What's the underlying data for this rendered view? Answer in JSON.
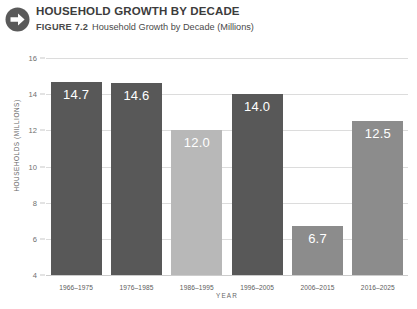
{
  "header": {
    "icon": "circle-arrow-right-icon",
    "title": "HOUSEHOLD GROWTH BY DECADE",
    "figure_label": "FIGURE 7.2",
    "figure_caption": "Household Growth by Decade (Millions)"
  },
  "colors": {
    "bar_dark": "#585858",
    "bar_medium": "#8c8c8c",
    "bar_light": "#b8b8b8",
    "gridline": "#dcdcdc",
    "value_label": "#ffffff",
    "icon": "#5a5a5a"
  },
  "chart_data": {
    "type": "bar",
    "title": "Household Growth by Decade (Millions)",
    "xlabel": "YEAR",
    "ylabel": "HOUSEHOLDS (MILLIONS)",
    "ylim": [
      4,
      16
    ],
    "yticks": [
      4,
      6,
      8,
      10,
      12,
      14,
      16
    ],
    "ytick_labels": [
      "4",
      "6",
      "8",
      "10",
      "12",
      "14",
      "16"
    ],
    "grid": true,
    "legend": false,
    "categories": [
      "1966–1975",
      "1976–1985",
      "1986–1995",
      "1996–2005",
      "2006–2015",
      "2016–2025"
    ],
    "values": [
      14.7,
      14.6,
      12.0,
      14.0,
      6.7,
      12.5
    ],
    "value_labels": [
      "14.7",
      "14.6",
      "12.0",
      "14.0",
      "6.7",
      "12.5"
    ],
    "bar_colors": [
      "#585858",
      "#585858",
      "#b8b8b8",
      "#585858",
      "#8c8c8c",
      "#8c8c8c"
    ]
  }
}
